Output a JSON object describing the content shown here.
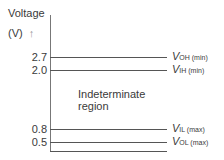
{
  "axis": {
    "title_line1": "Voltage",
    "title_line2": "(V)",
    "arrow": "↑"
  },
  "levels": [
    {
      "value": "2.7",
      "symbol": "V",
      "subscript": "OH (min)"
    },
    {
      "value": "2.0",
      "symbol": "V",
      "subscript": "IH (min)"
    },
    {
      "value": "0.8",
      "symbol": "V",
      "subscript": "IL (max)"
    },
    {
      "value": "0.5",
      "symbol": "V",
      "subscript": "OL (max)"
    }
  ],
  "region_label": {
    "line1": "Indeterminate",
    "line2": "region"
  }
}
